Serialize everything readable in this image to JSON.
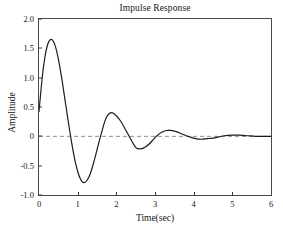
{
  "chart_data": {
    "type": "line",
    "title": "Impulse Response",
    "xlabel": "Time(sec)",
    "ylabel": "Amplitude",
    "xlim": [
      0,
      6
    ],
    "ylim": [
      -1.0,
      2.0
    ],
    "grid": false,
    "legend": null,
    "xticks": [
      0,
      1,
      2,
      3,
      4,
      5,
      6
    ],
    "xtick_labels": [
      "0",
      "1",
      "2",
      "3",
      "4",
      "5",
      "6"
    ],
    "yticks": [
      -1.0,
      -0.5,
      0,
      0.5,
      1.0,
      1.5,
      2.0
    ],
    "ytick_labels": [
      "-1.0",
      "-0.5",
      "0",
      "0.5",
      "1.0",
      "1.5",
      "2.0"
    ],
    "annotations": [
      {
        "name": "zero-reference-line",
        "kind": "hline",
        "y": 0,
        "style": "dashed",
        "color": "#8c8c8c"
      }
    ],
    "series": [
      {
        "name": "impulse response",
        "color": "#1c1c1c",
        "linewidth": 1.2,
        "style": "solid",
        "features": {
          "initial_value": 0.42,
          "first_peak": {
            "t": 0.33,
            "y": 1.65
          },
          "first_trough": {
            "t": 1.03,
            "y": -0.79
          },
          "second_peak": {
            "t": 1.75,
            "y": 0.4
          },
          "second_trough": {
            "t": 2.48,
            "y": -0.21
          },
          "third_peak": {
            "t": 3.17,
            "y": 0.1
          },
          "third_trough": {
            "t": 3.9,
            "y": -0.05
          },
          "settles_near": {
            "t": 4.6,
            "y": 0.0
          }
        },
        "x": [
          0.0,
          0.05,
          0.1,
          0.15,
          0.2,
          0.25,
          0.3,
          0.33,
          0.36,
          0.4,
          0.45,
          0.5,
          0.55,
          0.6,
          0.65,
          0.7,
          0.75,
          0.8,
          0.85,
          0.9,
          0.95,
          1.0,
          1.03,
          1.06,
          1.1,
          1.15,
          1.2,
          1.25,
          1.3,
          1.35,
          1.4,
          1.45,
          1.5,
          1.55,
          1.6,
          1.65,
          1.7,
          1.75,
          1.8,
          1.85,
          1.9,
          1.95,
          2.0,
          2.1,
          2.2,
          2.3,
          2.4,
          2.48,
          2.55,
          2.65,
          2.75,
          2.85,
          2.95,
          3.05,
          3.17,
          3.3,
          3.4,
          3.55,
          3.7,
          3.9,
          4.05,
          4.2,
          4.35,
          4.5,
          4.65,
          4.8,
          5.0,
          5.2,
          5.4,
          5.6,
          5.8,
          6.0
        ],
        "y": [
          0.42,
          0.78,
          1.1,
          1.34,
          1.51,
          1.61,
          1.65,
          1.65,
          1.63,
          1.58,
          1.47,
          1.32,
          1.14,
          0.94,
          0.72,
          0.5,
          0.28,
          0.07,
          -0.13,
          -0.31,
          -0.47,
          -0.6,
          -0.66,
          -0.71,
          -0.76,
          -0.79,
          -0.78,
          -0.74,
          -0.68,
          -0.59,
          -0.48,
          -0.36,
          -0.23,
          -0.1,
          0.02,
          0.14,
          0.25,
          0.33,
          0.38,
          0.4,
          0.4,
          0.38,
          0.35,
          0.27,
          0.16,
          0.04,
          -0.08,
          -0.17,
          -0.21,
          -0.21,
          -0.18,
          -0.13,
          -0.06,
          0.01,
          0.07,
          0.1,
          0.1,
          0.08,
          0.04,
          -0.01,
          -0.04,
          -0.05,
          -0.04,
          -0.03,
          -0.01,
          0.01,
          0.02,
          0.02,
          0.01,
          0.0,
          0.0,
          0.0
        ]
      }
    ]
  },
  "figure": {
    "background": "#ffffff",
    "frame_color": "#4a4a4a",
    "line_color": "#1c1c1c",
    "zero_line_color": "#8c8c8c"
  }
}
